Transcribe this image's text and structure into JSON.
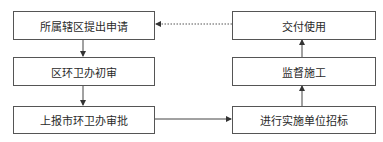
{
  "diagram": {
    "type": "flowchart",
    "cutoff_text": "………",
    "nodes": [
      {
        "id": "n1",
        "label": "所属辖区提出申请"
      },
      {
        "id": "n2",
        "label": "区环卫办初审"
      },
      {
        "id": "n3",
        "label": "上报市环卫办审批"
      },
      {
        "id": "n4",
        "label": "进行实施单位招标"
      },
      {
        "id": "n5",
        "label": "监督施工"
      },
      {
        "id": "n6",
        "label": "交付使用"
      }
    ],
    "edges": [
      {
        "from": "n1",
        "to": "n2",
        "style": "solid"
      },
      {
        "from": "n2",
        "to": "n3",
        "style": "solid"
      },
      {
        "from": "n3",
        "to": "n4",
        "style": "solid"
      },
      {
        "from": "n4",
        "to": "n5",
        "style": "solid"
      },
      {
        "from": "n5",
        "to": "n6",
        "style": "solid"
      },
      {
        "from": "n6",
        "to": "n1",
        "style": "dashed"
      }
    ]
  }
}
